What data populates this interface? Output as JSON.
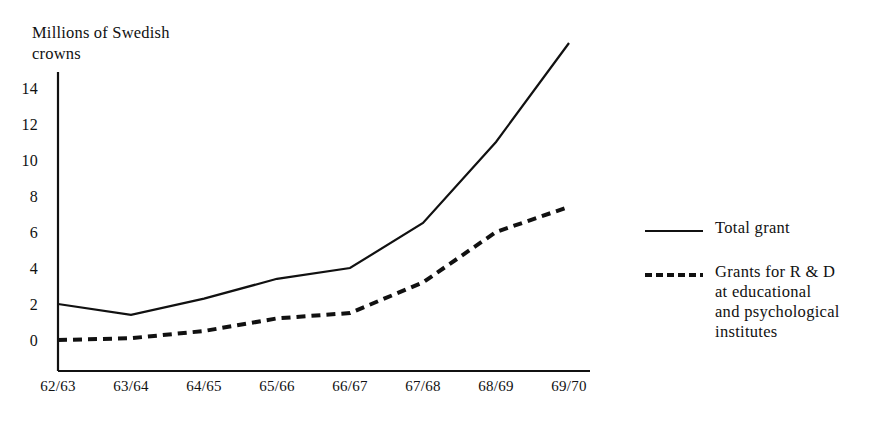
{
  "chart_data": {
    "type": "line",
    "title": "",
    "ylabel": "Millions of Swedish\ncrowns",
    "xlabel": "",
    "categories": [
      "62/63",
      "63/64",
      "64/65",
      "65/66",
      "66/67",
      "67/68",
      "68/69",
      "69/70"
    ],
    "ylim": [
      0,
      16.5
    ],
    "yticks": [
      0,
      2,
      4,
      6,
      8,
      10,
      12,
      14
    ],
    "ytick_labels": [
      "0",
      "2",
      "4",
      "6",
      "8",
      "10",
      "12",
      "14"
    ],
    "grid": false,
    "legend_position": "right",
    "series": [
      {
        "name": "Total grant",
        "style": "solid",
        "color": "#111111",
        "values": [
          2.0,
          1.4,
          2.3,
          3.4,
          4.0,
          6.5,
          11.0,
          16.5
        ]
      },
      {
        "name": "Grants for R & D\nat educational\nand psychological\ninstitutes",
        "style": "dashed",
        "color": "#111111",
        "values": [
          0.0,
          0.1,
          0.5,
          1.2,
          1.5,
          3.2,
          6.0,
          7.4
        ]
      }
    ]
  },
  "axis": {
    "title": "Millions of Swedish\ncrowns",
    "y_tick_labels": [
      "14",
      "12",
      "10",
      "8",
      "6",
      "4",
      "2",
      "0"
    ],
    "x_tick_labels": [
      "62/63",
      "63/64",
      "64/65",
      "65/66",
      "66/67",
      "67/68",
      "68/69",
      "69/70"
    ]
  },
  "legend": {
    "items": [
      {
        "label": "Total grant",
        "style": "solid"
      },
      {
        "label": "Grants for R & D\nat educational\nand psychological\ninstitutes",
        "style": "dashed"
      }
    ]
  }
}
